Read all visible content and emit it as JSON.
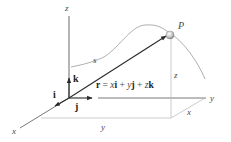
{
  "figure": {
    "axis_labels": {
      "x": "x",
      "y": "y",
      "z": "z"
    },
    "unit_vectors": {
      "i": "i",
      "j": "j",
      "k": "k"
    },
    "point_label": "P",
    "path_label": "s",
    "position_vector": {
      "lhs": "r",
      "eq": " = ",
      "x": "x",
      "i": "i",
      "plus1": " + ",
      "y": "y",
      "j": "j",
      "plus2": " + ",
      "z": "z",
      "k": "k"
    },
    "dimension_labels": {
      "x": "x",
      "y": "y",
      "z": "z"
    },
    "colors": {
      "axes": "#5a5a5a",
      "vector": "#2a2a2a",
      "curve": "#9a9a9a",
      "guide": "#b0b0b0",
      "point": "#bdbdbd"
    }
  }
}
